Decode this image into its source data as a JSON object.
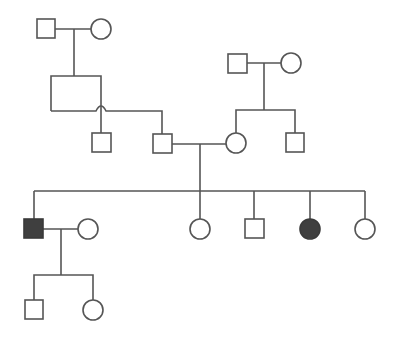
{
  "diagram": {
    "type": "pedigree",
    "colors": {
      "line": "#555555",
      "unaffected_fill": "#ffffff",
      "affected_fill": "#3f3f3f"
    },
    "generations": [
      {
        "label": "I",
        "individuals": [
          {
            "id": "I-1",
            "sex": "male",
            "affected": false,
            "shape": "square-icon"
          },
          {
            "id": "I-2",
            "sex": "female",
            "affected": false,
            "shape": "circle-icon"
          },
          {
            "id": "I-3",
            "sex": "male",
            "affected": false,
            "shape": "square-icon"
          },
          {
            "id": "I-4",
            "sex": "female",
            "affected": false,
            "shape": "circle-icon"
          }
        ]
      },
      {
        "label": "II",
        "individuals": [
          {
            "id": "II-1",
            "sex": "male",
            "affected": false,
            "shape": "square-icon"
          },
          {
            "id": "II-2",
            "sex": "male",
            "affected": false,
            "shape": "square-icon"
          },
          {
            "id": "II-3",
            "sex": "female",
            "affected": false,
            "shape": "circle-icon"
          },
          {
            "id": "II-4",
            "sex": "male",
            "affected": false,
            "shape": "square-icon"
          }
        ]
      },
      {
        "label": "III",
        "individuals": [
          {
            "id": "III-1",
            "sex": "male",
            "affected": true,
            "shape": "filled-square-icon"
          },
          {
            "id": "III-spouse",
            "sex": "female",
            "affected": false,
            "shape": "circle-icon"
          },
          {
            "id": "III-2",
            "sex": "female",
            "affected": false,
            "shape": "circle-icon"
          },
          {
            "id": "III-3",
            "sex": "male",
            "affected": false,
            "shape": "square-icon"
          },
          {
            "id": "III-4",
            "sex": "female",
            "affected": true,
            "shape": "filled-circle-icon"
          },
          {
            "id": "III-5",
            "sex": "female",
            "affected": false,
            "shape": "circle-icon"
          }
        ]
      },
      {
        "label": "IV",
        "individuals": [
          {
            "id": "IV-1",
            "sex": "male",
            "affected": false,
            "shape": "square-icon"
          },
          {
            "id": "IV-2",
            "sex": "female",
            "affected": false,
            "shape": "circle-icon"
          }
        ]
      }
    ]
  }
}
